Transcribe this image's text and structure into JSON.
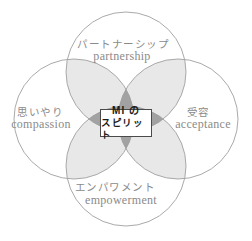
{
  "diagram": {
    "center": {
      "line1": "MI の",
      "line2": "スピリット"
    },
    "top": {
      "jp": "パートナーシップ",
      "en": "partnership"
    },
    "left": {
      "jp": "思いやり",
      "en": "compassion"
    },
    "right": {
      "jp": "受容",
      "en": "acceptance"
    },
    "bottom": {
      "jp": "エンパワメント",
      "en": "empowerment"
    },
    "colors": {
      "petal_fill": "#e8e8e8",
      "core_fill": "#a2a2a2",
      "circle_stroke": "#9f9f9f",
      "label_text": "#8a8a8a",
      "center_text": "#1a1a1a",
      "background": "#ffffff"
    }
  }
}
